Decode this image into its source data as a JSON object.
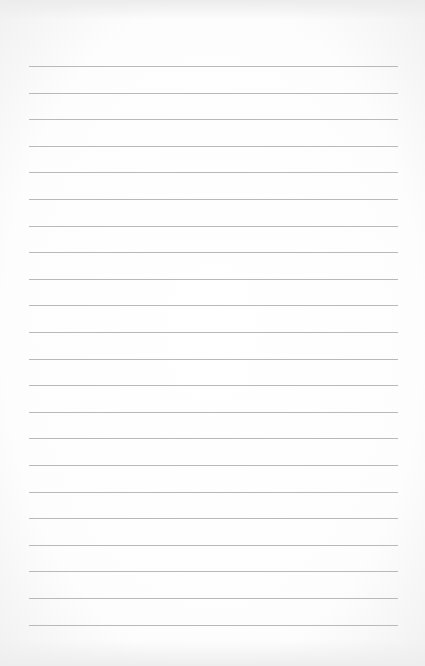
{
  "paper": {
    "type": "lined-paper",
    "background_color": "#ffffff",
    "line_color": "#b9b9b9",
    "line_count": 22,
    "first_line_y": 66,
    "line_spacing": 26.6,
    "line_left": 29,
    "line_right": 398
  }
}
